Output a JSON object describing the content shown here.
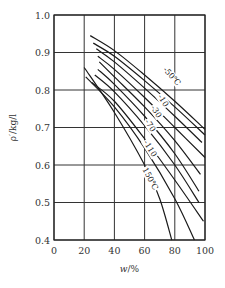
{
  "chart_data": {
    "type": "line",
    "title": "",
    "xlabel": "w/%",
    "ylabel": "ρ′/kg/l",
    "xlim": [
      0,
      100
    ],
    "ylim": [
      0.4,
      1.0
    ],
    "xticks": [
      "0",
      "20",
      "40",
      "60",
      "80",
      "100"
    ],
    "yticks": [
      "0.4",
      "0.5",
      "0.6",
      "0.7",
      "0.8",
      "0.9",
      "1.0"
    ],
    "grid": true,
    "legend": "inline labels on curves",
    "annotations": [
      "-50℃",
      "-10",
      "-30",
      "-70",
      "-110",
      "150℃"
    ],
    "series": [
      {
        "name": "-50℃",
        "points": [
          [
            24,
            0.945
          ],
          [
            40,
            0.905
          ],
          [
            60,
            0.84
          ],
          [
            80,
            0.77
          ],
          [
            100,
            0.695
          ]
        ]
      },
      {
        "name": "c2",
        "points": [
          [
            26,
            0.925
          ],
          [
            40,
            0.89
          ],
          [
            60,
            0.825
          ],
          [
            80,
            0.755
          ],
          [
            100,
            0.68
          ]
        ]
      },
      {
        "name": "-10",
        "points": [
          [
            28,
            0.91
          ],
          [
            40,
            0.875
          ],
          [
            60,
            0.805
          ],
          [
            80,
            0.73
          ],
          [
            98,
            0.66
          ]
        ]
      },
      {
        "name": "-30",
        "points": [
          [
            29,
            0.89
          ],
          [
            40,
            0.855
          ],
          [
            60,
            0.78
          ],
          [
            80,
            0.7
          ],
          [
            100,
            0.62
          ]
        ]
      },
      {
        "name": "-70",
        "points": [
          [
            30,
            0.875
          ],
          [
            40,
            0.835
          ],
          [
            60,
            0.755
          ],
          [
            80,
            0.665
          ],
          [
            97,
            0.575
          ]
        ]
      },
      {
        "name": "c6",
        "points": [
          [
            29,
            0.855
          ],
          [
            40,
            0.815
          ],
          [
            60,
            0.73
          ],
          [
            80,
            0.63
          ],
          [
            96,
            0.53
          ]
        ]
      },
      {
        "name": "-110",
        "points": [
          [
            27,
            0.84
          ],
          [
            40,
            0.795
          ],
          [
            60,
            0.705
          ],
          [
            80,
            0.6
          ],
          [
            96,
            0.5
          ]
        ]
      },
      {
        "name": "c8",
        "points": [
          [
            25,
            0.82
          ],
          [
            40,
            0.77
          ],
          [
            60,
            0.67
          ],
          [
            80,
            0.56
          ],
          [
            99,
            0.45
          ]
        ]
      },
      {
        "name": "c9",
        "points": [
          [
            21,
            0.835
          ],
          [
            40,
            0.755
          ],
          [
            60,
            0.645
          ],
          [
            80,
            0.51
          ],
          [
            93,
            0.4
          ]
        ]
      },
      {
        "name": "150℃",
        "points": [
          [
            20,
            0.86
          ],
          [
            40,
            0.74
          ],
          [
            60,
            0.6
          ],
          [
            70,
            0.51
          ],
          [
            78,
            0.4
          ]
        ]
      }
    ]
  },
  "axes": {
    "x_title_w": "w",
    "x_title_rest": "/%",
    "y_title": "ρ′/kg/l"
  }
}
